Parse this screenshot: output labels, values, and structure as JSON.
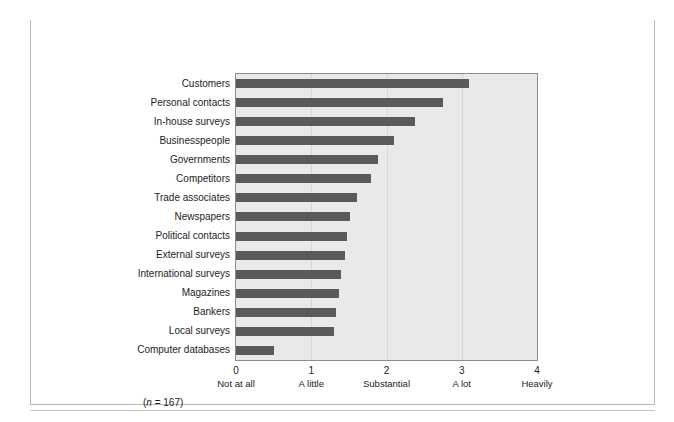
{
  "figure": {
    "label": "FIGURE 6.4",
    "caption": "Sources of information in the Asia–Pacific region",
    "sample_note_prefix": "(",
    "sample_note_italic": "n",
    "sample_note_suffix": " = 167)"
  },
  "chart_data": {
    "type": "bar",
    "orientation": "horizontal",
    "title": "Sources of information in the Asia–Pacific region",
    "xlabel": "",
    "ylabel": "",
    "xlim": [
      0,
      4
    ],
    "grid": true,
    "legend": "none",
    "bar_color": "#5a5a5a",
    "plot_background": "#e9e9e9",
    "plot_border_color": "#8d8d8d",
    "sample_size": 167,
    "tick_values": [
      0,
      1,
      2,
      3,
      4
    ],
    "tick_labels": [
      "0",
      "1",
      "2",
      "3",
      "4"
    ],
    "tick_descriptions": [
      "Not at all",
      "A little",
      "Substantial",
      "A lot",
      "Heavily"
    ],
    "categories": [
      "Customers",
      "Personal contacts",
      "In-house surveys",
      "Businesspeople",
      "Governments",
      "Competitors",
      "Trade associates",
      "Newspapers",
      "Political contacts",
      "External surveys",
      "International surveys",
      "Magazines",
      "Bankers",
      "Local surveys",
      "Computer databases"
    ],
    "values": [
      3.09,
      2.75,
      2.38,
      2.1,
      1.89,
      1.79,
      1.61,
      1.51,
      1.47,
      1.45,
      1.4,
      1.37,
      1.33,
      1.3,
      0.51
    ]
  }
}
